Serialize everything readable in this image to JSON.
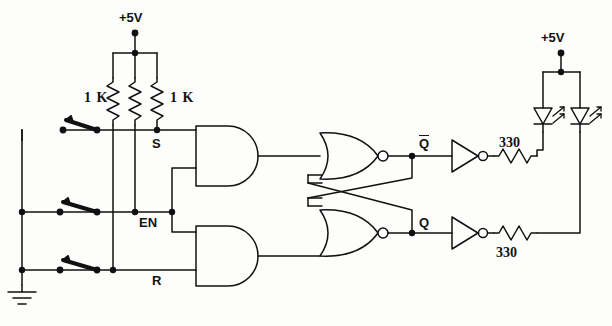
{
  "diagram": {
    "type": "schematic",
    "ink_color": "#111111",
    "background": "#fdfdfb"
  },
  "power": {
    "left_supply_label": "+5V",
    "right_supply_label": "+5V"
  },
  "resistors": {
    "pullup_left_label": "1 K",
    "pullup_right_label": "1 K",
    "pullup_values": [
      "1 K",
      "1 K",
      "1 K"
    ],
    "led_series_top_label": "330",
    "led_series_bottom_label": "330"
  },
  "nodes": {
    "s_label": "S",
    "en_label": "EN",
    "r_label": "R",
    "qbar_label": "Q",
    "q_label": "Q"
  },
  "switches": [
    {
      "name": "set-switch",
      "node": "S",
      "state": "open"
    },
    {
      "name": "enable-switch",
      "node": "EN",
      "state": "open"
    },
    {
      "name": "reset-switch",
      "node": "R",
      "state": "open"
    }
  ],
  "gates": [
    {
      "name": "and-gate-set",
      "type": "AND",
      "inputs": [
        "S",
        "EN"
      ]
    },
    {
      "name": "and-gate-reset",
      "type": "AND",
      "inputs": [
        "EN",
        "R"
      ]
    },
    {
      "name": "nor-gate-top",
      "type": "NOR",
      "output": "Qbar"
    },
    {
      "name": "nor-gate-bottom",
      "type": "NOR",
      "output": "Q"
    },
    {
      "name": "inverter-top",
      "type": "NOT"
    },
    {
      "name": "inverter-bottom",
      "type": "NOT"
    }
  ],
  "leds": [
    {
      "name": "led-qbar",
      "driven_by": "Qbar"
    },
    {
      "name": "led-q",
      "driven_by": "Q"
    }
  ],
  "ground": {
    "label": ""
  }
}
